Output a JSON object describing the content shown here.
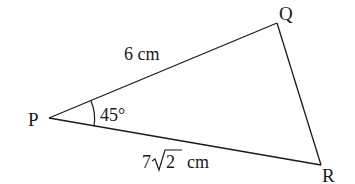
{
  "figure": {
    "type": "triangle",
    "vertices": {
      "P": {
        "label": "P",
        "x": 49,
        "y": 118
      },
      "Q": {
        "label": "Q",
        "x": 277,
        "y": 23
      },
      "R": {
        "label": "R",
        "x": 321,
        "y": 165
      }
    },
    "sides": {
      "PQ": {
        "label": "6 cm"
      },
      "PR": {
        "coefficient": "7",
        "radicand": "2",
        "unit": "cm"
      }
    },
    "angles": {
      "P": {
        "label": "45°"
      }
    },
    "colors": {
      "stroke": "#1a1a1a",
      "background": "#ffffff"
    }
  }
}
